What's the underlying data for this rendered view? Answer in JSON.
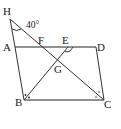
{
  "diagram": {
    "points": {
      "H": {
        "label": "H",
        "x": 10,
        "y": 19
      },
      "A": {
        "label": "A",
        "x": 15,
        "y": 47
      },
      "F": {
        "label": "F",
        "x": 41,
        "y": 47
      },
      "E": {
        "label": "E",
        "x": 68,
        "y": 47
      },
      "D": {
        "label": "D",
        "x": 96,
        "y": 47
      },
      "G": {
        "label": "G",
        "x": 57,
        "y": 61
      },
      "B": {
        "label": "B",
        "x": 24,
        "y": 100
      },
      "C": {
        "label": "C",
        "x": 104,
        "y": 100
      }
    },
    "angle_label": "40°",
    "segments": [
      "A-D",
      "D-C",
      "C-B",
      "B-A",
      "H-A",
      "H-C",
      "B-E"
    ],
    "markers": {
      "B": "two dots (angle bisector)",
      "C": "two small circles (angle bisector)",
      "E": "arc angle marker",
      "H": "arc angle marker 40°"
    },
    "colors": {
      "stroke": "#333333",
      "text": "#222222",
      "background": "#ffffff"
    }
  }
}
